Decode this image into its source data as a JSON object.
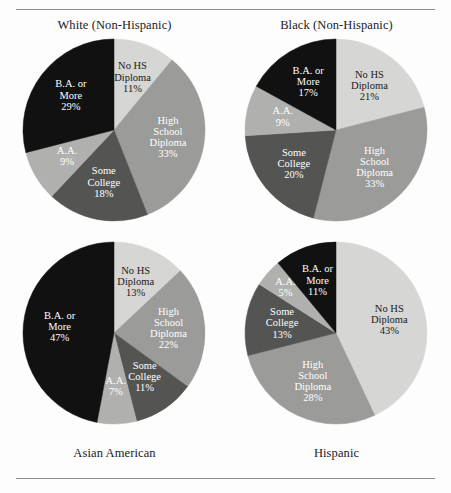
{
  "page": {
    "background": "#fdfdfd",
    "rule_color": "#8d8d90"
  },
  "palette": {
    "no_hs": "#d6d6d4",
    "high_school": "#9b9b99",
    "some_college": "#545453",
    "aa": "#b0b0ae",
    "ba_more": "#111111",
    "label_light": "#ffffff",
    "label_dark": "#1a1a1a"
  },
  "chart_data": {
    "type": "pie",
    "title": "",
    "legend_position": "none",
    "categories": [
      "No HS Diploma",
      "High School Diploma",
      "Some College",
      "A.A.",
      "B.A. or More"
    ],
    "category_labels": [
      [
        "No HS",
        "Diploma"
      ],
      [
        "High",
        "School",
        "Diploma"
      ],
      [
        "Some",
        "College"
      ],
      [
        "A.A."
      ],
      [
        "B.A. or",
        "More"
      ]
    ],
    "colors": [
      "#d6d6d4",
      "#9b9b99",
      "#545453",
      "#b0b0ae",
      "#111111"
    ],
    "label_colors": [
      "#1a1a1a",
      "#ffffff",
      "#ffffff",
      "#ffffff",
      "#ffffff"
    ],
    "units": "percent",
    "start_angle_deg": 0,
    "direction": "clockwise",
    "series": [
      {
        "name": "White (Non-Hispanic)",
        "values": [
          11,
          33,
          18,
          9,
          29
        ],
        "value_labels": [
          "11%",
          "33%",
          "18%",
          "9%",
          "29%"
        ]
      },
      {
        "name": "Black (Non-Hispanic)",
        "values": [
          21,
          33,
          20,
          9,
          17
        ],
        "value_labels": [
          "21%",
          "33%",
          "20%",
          "9%",
          "17%"
        ]
      },
      {
        "name": "Asian American",
        "values": [
          13,
          22,
          11,
          7,
          47
        ],
        "value_labels": [
          "13%",
          "22%",
          "11%",
          "7%",
          "47%"
        ]
      },
      {
        "name": "Hispanic",
        "values": [
          43,
          28,
          13,
          5,
          11
        ],
        "value_labels": [
          "43%",
          "28%",
          "13%",
          "5%",
          "11%"
        ]
      }
    ]
  },
  "captions": {
    "white": "White (Non-Hispanic)",
    "black": "Black (Non-Hispanic)",
    "asian": "Asian American",
    "hispanic": "Hispanic"
  }
}
